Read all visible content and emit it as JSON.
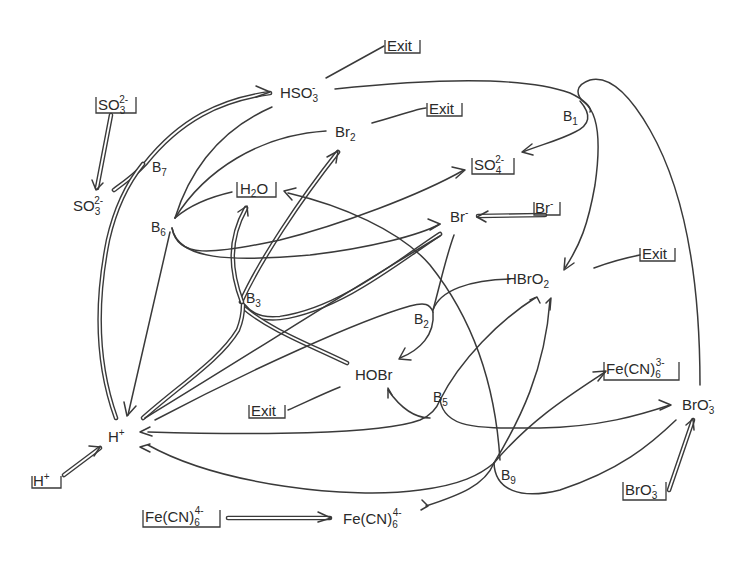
{
  "diagram": {
    "type": "reaction-network",
    "species": {
      "hso3": {
        "base": "HSO",
        "sub": "3",
        "sup": "-"
      },
      "so3_free": {
        "base": "SO",
        "sub": "3",
        "sup": "2-"
      },
      "br2": {
        "base": "Br",
        "sub": "2",
        "sup": ""
      },
      "br_minus": {
        "base": "Br",
        "sub": "",
        "sup": "-"
      },
      "hbro2": {
        "base": "HBrO",
        "sub": "2",
        "sup": ""
      },
      "hobr": {
        "base": "HOBr",
        "sub": "",
        "sup": ""
      },
      "h_plus": {
        "base": "H",
        "sub": "",
        "sup": "+"
      },
      "bro3": {
        "base": "BrO",
        "sub": "3",
        "sup": "-"
      },
      "fecn6_4": {
        "base": "Fe(CN)",
        "sub": "6",
        "sup": "4-"
      }
    },
    "boxed_species": {
      "so3_in": {
        "base": "SO",
        "sub": "3",
        "sup": "2-"
      },
      "so4_out": {
        "base": "SO",
        "sub": "4",
        "sup": "2-"
      },
      "h2o": {
        "base": "H",
        "sub": "2",
        "tail": "O"
      },
      "br_in": {
        "base": "Br",
        "sup": "-"
      },
      "h_in": {
        "base": "H",
        "sup": "+"
      },
      "fecn6_4_in": {
        "base": "Fe(CN)",
        "sub": "6",
        "sup": "4-"
      },
      "fecn6_3_out": {
        "base": "Fe(CN)",
        "sub": "6",
        "sup": "3-"
      },
      "bro3_in": {
        "base": "BrO",
        "sub": "3",
        "sup": "-"
      }
    },
    "exit_label": "Exit",
    "reaction_nodes": [
      {
        "id": "B1",
        "base": "B",
        "sub": "1"
      },
      {
        "id": "B2",
        "base": "B",
        "sub": "2"
      },
      {
        "id": "B3",
        "base": "B",
        "sub": "3"
      },
      {
        "id": "B5",
        "base": "B",
        "sub": "5"
      },
      {
        "id": "B6",
        "base": "B",
        "sub": "6"
      },
      {
        "id": "B7",
        "base": "B",
        "sub": "7"
      },
      {
        "id": "B9",
        "base": "B",
        "sub": "9"
      }
    ],
    "edges": [
      {
        "from": "SO3(2-) in",
        "to": "SO3(2-)",
        "style": "double"
      },
      {
        "from": "SO3(2-)",
        "to": "B7",
        "style": "double"
      },
      {
        "from": "H+",
        "to": "B7",
        "style": "double"
      },
      {
        "from": "B7",
        "to": "HSO3-",
        "style": "double"
      },
      {
        "from": "HSO3-",
        "to": "Exit",
        "style": "single"
      },
      {
        "from": "HSO3-",
        "to": "B1",
        "style": "single"
      },
      {
        "from": "B1",
        "to": "SO4(2-)",
        "style": "single"
      },
      {
        "from": "B1",
        "to": "HBrO2",
        "style": "single"
      },
      {
        "from": "BrO3-",
        "to": "B1",
        "style": "single"
      },
      {
        "from": "Br2",
        "to": "Exit",
        "style": "single"
      },
      {
        "from": "HSO3-",
        "to": "B6",
        "style": "single"
      },
      {
        "from": "Br2",
        "to": "B6",
        "style": "single"
      },
      {
        "from": "B6",
        "to": "H2O",
        "style": "single"
      },
      {
        "from": "B6",
        "to": "SO4(2-)",
        "style": "single"
      },
      {
        "from": "B6",
        "to": "Br-",
        "style": "single"
      },
      {
        "from": "B6",
        "to": "H+",
        "style": "single"
      },
      {
        "from": "Br- in",
        "to": "Br-",
        "style": "double"
      },
      {
        "from": "Br-",
        "to": "B3",
        "style": "double"
      },
      {
        "from": "HOBr",
        "to": "B3",
        "style": "double"
      },
      {
        "from": "H+",
        "to": "B3",
        "style": "double"
      },
      {
        "from": "B3",
        "to": "Br2",
        "style": "double"
      },
      {
        "from": "B3",
        "to": "H2O",
        "style": "double"
      },
      {
        "from": "Br-",
        "to": "B2",
        "style": "single"
      },
      {
        "from": "HBrO2",
        "to": "B2",
        "style": "single"
      },
      {
        "from": "H+",
        "to": "B2",
        "style": "single"
      },
      {
        "from": "B2",
        "to": "HOBr",
        "style": "single"
      },
      {
        "from": "HBrO2",
        "to": "Exit",
        "style": "single"
      },
      {
        "from": "HOBr",
        "to": "Exit",
        "style": "single"
      },
      {
        "from": "H+ in",
        "to": "H+",
        "style": "double"
      },
      {
        "from": "H+",
        "to": "B5",
        "style": "single"
      },
      {
        "from": "B5",
        "to": "HOBr",
        "style": "single"
      },
      {
        "from": "B5",
        "to": "BrO3-",
        "style": "single"
      },
      {
        "from": "B5",
        "to": "HBrO2",
        "style": "single"
      },
      {
        "from": "H+",
        "to": "B9",
        "style": "single"
      },
      {
        "from": "BrO3-",
        "to": "B9",
        "style": "single"
      },
      {
        "from": "Fe(CN)6(4-)",
        "to": "B9",
        "style": "single"
      },
      {
        "from": "B9",
        "to": "Fe(CN)6(3-)",
        "style": "single"
      },
      {
        "from": "B9",
        "to": "HBrO2",
        "style": "single"
      },
      {
        "from": "B9",
        "to": "H2O",
        "style": "single"
      },
      {
        "from": "Fe(CN)6(4-) in",
        "to": "Fe(CN)6(4-)",
        "style": "double"
      },
      {
        "from": "BrO3- in",
        "to": "BrO3-",
        "style": "double"
      }
    ]
  }
}
